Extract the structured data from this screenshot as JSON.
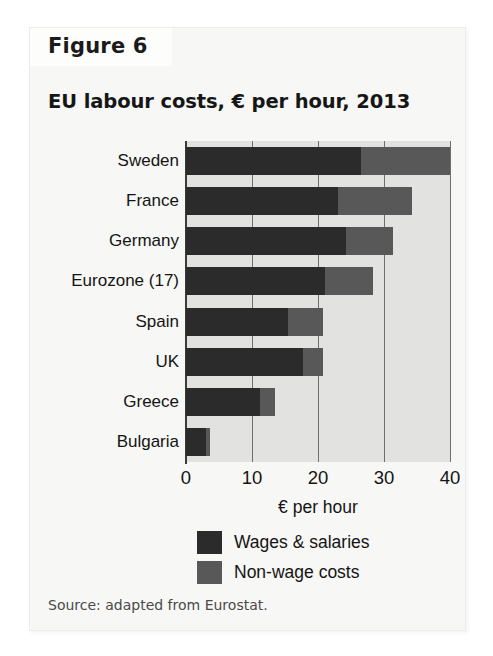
{
  "figure": {
    "number_label": "Figure 6",
    "source_note": "Source: adapted from Eurostat."
  },
  "chart_data": {
    "type": "bar",
    "orientation": "horizontal",
    "stacked": true,
    "title": "EU labour costs, € per hour, 2013",
    "xlabel": "€ per hour",
    "ylabel": "",
    "xlim": [
      0,
      40
    ],
    "xticks": [
      0,
      10,
      20,
      30,
      40
    ],
    "xticklabels": [
      "0",
      "10",
      "20",
      "30",
      "40"
    ],
    "grid": "vertical",
    "legend_position": "below-axis",
    "categories": [
      "Sweden",
      "France",
      "Germany",
      "Eurozone (17)",
      "Spain",
      "UK",
      "Greece",
      "Bulgaria"
    ],
    "series": [
      {
        "name": "Wages & salaries",
        "color": "#2b2b2b",
        "values": [
          26.5,
          23.0,
          24.3,
          21.0,
          15.5,
          17.8,
          11.2,
          3.0
        ]
      },
      {
        "name": "Non-wage costs",
        "color": "#585858",
        "values": [
          13.5,
          11.2,
          7.0,
          7.3,
          5.3,
          2.9,
          2.3,
          0.7
        ]
      }
    ],
    "totals": [
      40.0,
      34.2,
      31.3,
      28.3,
      20.8,
      20.7,
      13.5,
      3.7
    ]
  },
  "colors": {
    "plot_background": "#e2e2e1",
    "card_background": "#f7f7f5",
    "tab_background": "#fdfdfc",
    "axis": "#3b3b3b",
    "gridline": "#6e6e6e",
    "text": "#141414"
  }
}
